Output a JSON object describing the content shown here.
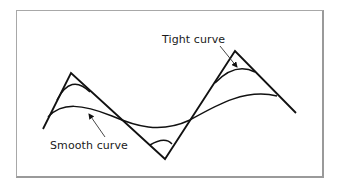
{
  "diagram": {
    "labels": {
      "tight": "Tight curve",
      "smooth": "Smooth curve"
    },
    "colors": {
      "stroke": "#111111",
      "frame": "#a0a0a0",
      "background": "#ffffff"
    },
    "control_polygon": [
      [
        43,
        129
      ],
      [
        71,
        73
      ],
      [
        165,
        159
      ],
      [
        235,
        51
      ],
      [
        296,
        113
      ]
    ],
    "tight_curve": "M57,100 Q71,73 90,92 L150,145 Q165,159 172,143 L215,83 Q235,51 255,72",
    "smooth_curve": "M50,114 C70,98 90,110 125,122 C150,132 175,130 200,112 C230,95 255,82 277,96"
  }
}
